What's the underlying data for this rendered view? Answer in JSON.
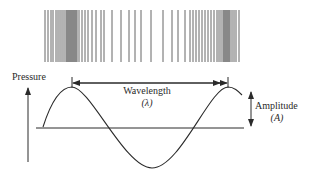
{
  "diagram": {
    "labels": {
      "y_axis": "Pressure",
      "wavelength": "Wavelength",
      "wavelength_symbol": "(λ)",
      "amplitude": "Amplitude",
      "amplitude_symbol": "(A)"
    },
    "colors": {
      "line": "#2a2a2a",
      "bars": "#555555",
      "background": "#ffffff"
    },
    "bars": {
      "top": 10,
      "bottom": 62,
      "x": [
        45,
        48,
        51,
        53,
        56,
        58,
        60,
        62,
        64,
        66,
        67,
        68,
        69,
        70,
        71,
        72,
        73,
        74,
        75,
        76,
        77,
        79,
        82,
        85,
        88,
        92,
        96,
        101,
        104,
        112,
        121,
        129,
        135,
        141,
        151,
        163,
        172,
        178,
        185,
        190,
        193,
        196,
        199,
        202,
        205,
        208,
        211,
        214,
        217,
        219,
        221,
        223,
        224,
        225,
        226,
        227,
        228,
        229,
        230,
        232,
        234,
        236,
        239
      ]
    },
    "wave": {
      "start": [
        43,
        127
      ],
      "peak1": [
        72,
        87
      ],
      "trough": [
        152,
        168
      ],
      "peak2": [
        228,
        87
      ],
      "end": [
        242,
        95
      ]
    }
  }
}
